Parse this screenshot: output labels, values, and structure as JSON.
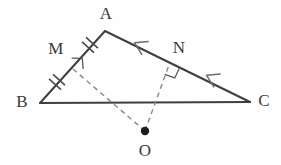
{
  "figure": {
    "background_color": "#fefefe",
    "stroke_color": "#3f3f3f",
    "dash_color": "#8a8a8a",
    "label_color": "#3a3a3a",
    "width": 281,
    "height": 165
  },
  "points": [
    {
      "id": "A",
      "label": "A",
      "x": 105,
      "y": 31,
      "label_x": 106,
      "label_y": 13
    },
    {
      "id": "B",
      "label": "B",
      "x": 40,
      "y": 103,
      "label_x": 22,
      "label_y": 101
    },
    {
      "id": "C",
      "label": "C",
      "x": 250,
      "y": 102,
      "label_x": 264,
      "label_y": 100
    },
    {
      "id": "M",
      "label": "M",
      "x": 73,
      "y": 69,
      "label_x": 56,
      "label_y": 48
    },
    {
      "id": "N",
      "label": "N",
      "x": 169,
      "y": 65,
      "label_x": 179,
      "label_y": 47
    },
    {
      "id": "O",
      "label": "O",
      "x": 145,
      "y": 131,
      "label_x": 145,
      "label_y": 150
    }
  ],
  "solid_segments": [
    {
      "name": "side-AB",
      "from": "A",
      "to": "B",
      "x1": 105,
      "y1": 31,
      "x2": 40,
      "y2": 103
    },
    {
      "name": "side-BC",
      "from": "B",
      "to": "C",
      "x1": 40,
      "y1": 103,
      "x2": 250,
      "y2": 102
    },
    {
      "name": "side-AC",
      "from": "A",
      "to": "C",
      "x1": 105,
      "y1": 31,
      "x2": 250,
      "y2": 102
    }
  ],
  "dashed_segments": [
    {
      "name": "perpendicular-OM",
      "from": "O",
      "to": "M",
      "x1": 145,
      "y1": 131,
      "x2": 73,
      "y2": 69
    },
    {
      "name": "perpendicular-ON",
      "from": "O",
      "to": "N",
      "x1": 145,
      "y1": 131,
      "x2": 169,
      "y2": 65
    }
  ],
  "tick_marks": [
    {
      "name": "double-tick-AM",
      "segment": "AB",
      "count": 2,
      "x": 90,
      "y": 45
    },
    {
      "name": "double-tick-MB",
      "segment": "AB",
      "count": 2,
      "x": 57,
      "y": 82
    }
  ],
  "chevron_marks": [
    {
      "name": "chevron-AN",
      "segment": "AC",
      "x": 140,
      "y": 45
    },
    {
      "name": "chevron-NC",
      "segment": "AC",
      "x": 212,
      "y": 78
    }
  ],
  "right_angle_marks": [
    {
      "name": "right-angle-at-M",
      "x": 73,
      "y": 69
    },
    {
      "name": "right-angle-at-N",
      "x": 169,
      "y": 65
    }
  ],
  "center_dot": {
    "name": "circumcenter-dot",
    "x": 145,
    "y": 131,
    "radius": 4.2
  }
}
